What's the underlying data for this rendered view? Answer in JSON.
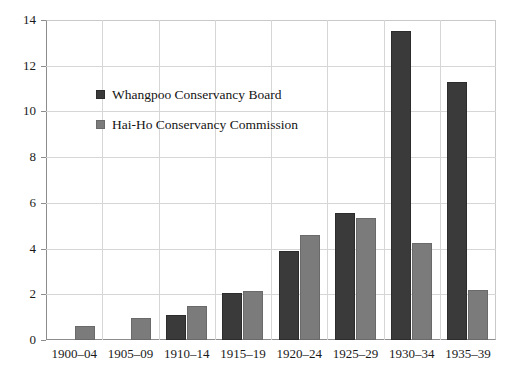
{
  "chart_data": {
    "type": "bar",
    "title": "",
    "subtitle": "",
    "xlabel": "",
    "ylabel": "",
    "ylim": [
      0,
      14
    ],
    "ytick_step": 2,
    "yticks": [
      "0",
      "2",
      "4",
      "6",
      "8",
      "10",
      "12",
      "14"
    ],
    "grid": "both",
    "legend_position": "inside-upper-left",
    "categories": [
      "1900–04",
      "1905–09",
      "1910–14",
      "1915–19",
      "1920–24",
      "1925–29",
      "1930–34",
      "1935–39"
    ],
    "series": [
      {
        "name": "Whangpoo Conservancy Board",
        "color": "#3a3a3a",
        "values": [
          0,
          0,
          1.1,
          2.05,
          3.9,
          5.55,
          13.5,
          11.3
        ]
      },
      {
        "name": "Hai-Ho Conservancy Commission",
        "color": "#7b7b7b",
        "values": [
          0.6,
          0.95,
          1.5,
          2.15,
          4.6,
          5.35,
          4.25,
          2.2
        ]
      }
    ]
  },
  "legend": {
    "items": [
      {
        "label": "Whangpoo Conservancy Board",
        "swatch": "legend-swatch-dark"
      },
      {
        "label": "Hai-Ho Conservancy Commission",
        "swatch": "legend-swatch-gray"
      }
    ]
  },
  "colors": {
    "series_0": "#3a3a3a",
    "series_1": "#7b7b7b",
    "gridline": "#d6d6d6",
    "axis": "#8d8d8d",
    "frame": "#c9c9c9",
    "background": "#ffffff",
    "text": "#1a1a1a"
  }
}
